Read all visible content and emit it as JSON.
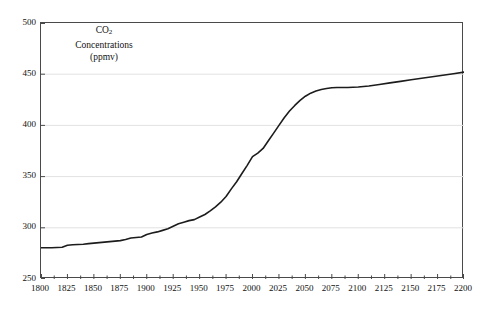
{
  "chart_data": {
    "type": "line",
    "title_lines": [
      "CO2",
      "Concentrations",
      "(ppmv)"
    ],
    "title_line_1_main": "CO",
    "title_line_1_sub": "2",
    "title_line_2": "Concentrations",
    "title_line_3": "(ppmv)",
    "xlabel": "",
    "ylabel": "CO2 Concentrations (ppmv)",
    "xlim": [
      1800,
      2200
    ],
    "ylim": [
      250,
      500
    ],
    "grid": true,
    "grid_axis": "y",
    "legend": "none",
    "line_color": "#1c1c1c",
    "grid_color": "#e2e2e2",
    "axis_color": "#4a4a4a",
    "background": "#ffffff",
    "x_ticks": [
      1800,
      1825,
      1850,
      1875,
      1900,
      1925,
      1950,
      1975,
      2000,
      2025,
      2050,
      2075,
      2100,
      2125,
      2150,
      2175,
      2200
    ],
    "x_tick_labels": [
      "1800",
      "1825",
      "1850",
      "1875",
      "1900",
      "1925",
      "1950",
      "1975",
      "2000",
      "2025",
      "2050",
      "2075",
      "2100",
      "2125",
      "2150",
      "2175",
      "2200"
    ],
    "x_minor_tick_interval": 12.5,
    "y_ticks": [
      250,
      300,
      350,
      400,
      450,
      500
    ],
    "y_tick_labels": [
      "250",
      "300",
      "350",
      "400",
      "450",
      "500"
    ],
    "series": [
      {
        "name": "CO2 concentration",
        "x": [
          1800,
          1810,
          1820,
          1825,
          1830,
          1840,
          1845,
          1850,
          1855,
          1860,
          1870,
          1875,
          1880,
          1885,
          1890,
          1895,
          1900,
          1905,
          1910,
          1915,
          1920,
          1925,
          1930,
          1935,
          1940,
          1945,
          1950,
          1955,
          1960,
          1965,
          1970,
          1975,
          1980,
          1985,
          1990,
          1995,
          2000,
          2005,
          2010,
          2015,
          2020,
          2025,
          2030,
          2035,
          2040,
          2045,
          2050,
          2055,
          2060,
          2065,
          2070,
          2075,
          2080,
          2085,
          2090,
          2095,
          2100,
          2110,
          2120,
          2130,
          2140,
          2150,
          2160,
          2170,
          2180,
          2190,
          2200
        ],
        "y": [
          280.5,
          280.5,
          281.0,
          283.0,
          283.5,
          284.0,
          284.5,
          285.0,
          285.5,
          286.0,
          287.0,
          287.5,
          288.5,
          290.0,
          290.5,
          291.0,
          293.5,
          295.0,
          296.0,
          297.5,
          299.0,
          301.5,
          304.0,
          305.5,
          307.0,
          308.0,
          310.5,
          313.0,
          316.5,
          320.5,
          325.0,
          330.5,
          338.0,
          345.0,
          353.0,
          361.0,
          369.5,
          373.0,
          377.5,
          385.0,
          392.5,
          400.0,
          407.5,
          414.0,
          419.5,
          424.5,
          428.5,
          431.5,
          433.5,
          435.0,
          436.0,
          436.8,
          437.0,
          437.0,
          437.0,
          437.2,
          437.5,
          438.5,
          440.0,
          441.5,
          443.0,
          444.5,
          446.0,
          447.5,
          449.0,
          450.5,
          452.0
        ]
      }
    ]
  }
}
